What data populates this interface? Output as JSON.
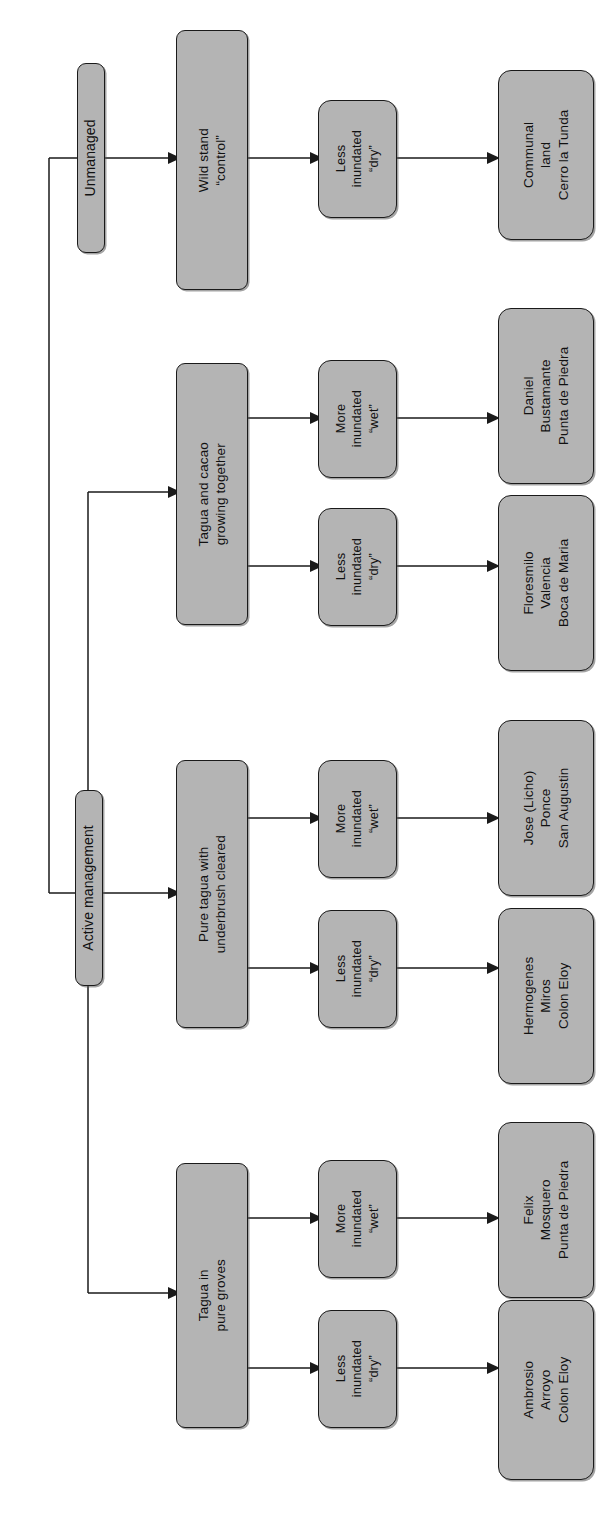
{
  "diagram": {
    "orientation": "rotated-90-ccw",
    "colors": {
      "node_fill": "#b4b4b4",
      "node_border": "#1a1a1a",
      "connector": "#1a1a1a",
      "background": "#ffffff"
    },
    "levels": [
      "management category",
      "stand type",
      "inundation regime",
      "landholder and community"
    ]
  },
  "nodes": {
    "management": [
      {
        "id": "unmanaged",
        "label": "Unmanaged"
      },
      {
        "id": "active",
        "label": "Active management"
      }
    ],
    "stands": [
      {
        "id": "wild",
        "line1": "Wild stand",
        "line2": "“control”"
      },
      {
        "id": "cacao",
        "line1": "Tagua and cacao",
        "line2": "growing together"
      },
      {
        "id": "cleared",
        "line1": "Pure tagua with",
        "line2": "underbrush cleared"
      },
      {
        "id": "groves",
        "line1": "Tagua in",
        "line2": "pure groves"
      }
    ],
    "inundation": [
      {
        "id": "wild-dry",
        "line1": "Less",
        "line2": "inundated",
        "line3": "“dry”"
      },
      {
        "id": "cacao-wet",
        "line1": "More",
        "line2": "inundated",
        "line3": "“wet”"
      },
      {
        "id": "cacao-dry",
        "line1": "Less",
        "line2": "inundated",
        "line3": "“dry”"
      },
      {
        "id": "cleared-wet",
        "line1": "More",
        "line2": "inundated",
        "line3": "“wet”"
      },
      {
        "id": "cleared-dry",
        "line1": "Less",
        "line2": "inundated",
        "line3": "“dry”"
      },
      {
        "id": "groves-wet",
        "line1": "More",
        "line2": "inundated",
        "line3": "“wet”"
      },
      {
        "id": "groves-dry",
        "line1": "Less",
        "line2": "inundated",
        "line3": "“dry”"
      }
    ],
    "sites": [
      {
        "id": "site-communal",
        "line1": "Communal",
        "line2": "land",
        "line3": "Cerro la Tunda"
      },
      {
        "id": "site-daniel",
        "line1": "Daniel",
        "line2": "Bustamante",
        "line3": "Punta de Piedra"
      },
      {
        "id": "site-floresmilo",
        "line1": "Floresmilo",
        "line2": "Valencia",
        "line3": "Boca de Maria"
      },
      {
        "id": "site-jose",
        "line1": "Jose (Licho)",
        "line2": "Ponce",
        "line3": "San Augustin"
      },
      {
        "id": "site-hermogenes",
        "line1": "Hermogenes",
        "line2": "Miros",
        "line3": "Colon Eloy"
      },
      {
        "id": "site-felix",
        "line1": "Felix",
        "line2": "Mosquero",
        "line3": "Punta de Piedra"
      },
      {
        "id": "site-ambrosio",
        "line1": "Ambrosio",
        "line2": "Arroyo",
        "line3": "Colon Eloy"
      }
    ]
  }
}
